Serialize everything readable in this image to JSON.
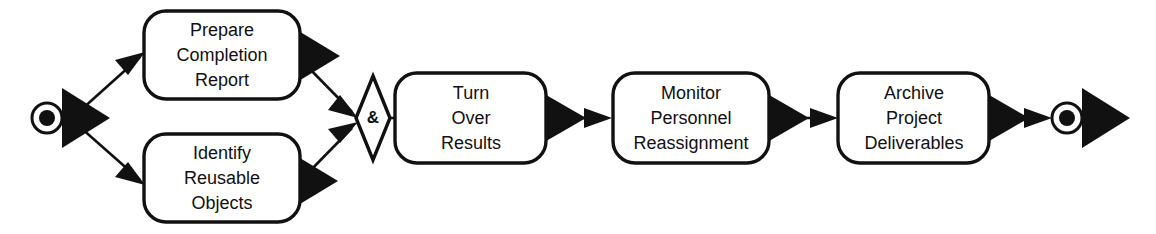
{
  "diagram": {
    "type": "activity-diagram",
    "colors": {
      "stroke": "#111111",
      "fill": "#ffffff",
      "text": "#111111"
    },
    "start_node": {
      "name": "start-node",
      "label": ""
    },
    "end_node": {
      "name": "end-node",
      "label": ""
    },
    "gateway": {
      "name": "and-join-gateway",
      "label": "&"
    },
    "activities": [
      {
        "id": "prepare-completion-report",
        "lines": [
          "Prepare",
          "Completion",
          "Report"
        ]
      },
      {
        "id": "identify-reusable-objects",
        "lines": [
          "Identify",
          "Reusable",
          "Objects"
        ]
      },
      {
        "id": "turn-over-results",
        "lines": [
          "Turn",
          "Over",
          "Results"
        ]
      },
      {
        "id": "monitor-personnel-reassignment",
        "lines": [
          "Monitor",
          "Personnel",
          "Reassignment"
        ]
      },
      {
        "id": "archive-project-deliverables",
        "lines": [
          "Archive",
          "Project",
          "Deliverables"
        ]
      }
    ],
    "flows": [
      {
        "id": "flow-start-to-prepare",
        "from": "start-node",
        "to": "prepare-completion-report",
        "label": ""
      },
      {
        "id": "flow-start-to-identify",
        "from": "start-node",
        "to": "identify-reusable-objects",
        "label": ""
      },
      {
        "id": "flow-prepare-to-gateway",
        "from": "prepare-completion-report",
        "to": "and-join-gateway",
        "label": ""
      },
      {
        "id": "flow-identify-to-gateway",
        "from": "identify-reusable-objects",
        "to": "and-join-gateway",
        "label": ""
      },
      {
        "id": "flow-gateway-to-turnover",
        "from": "and-join-gateway",
        "to": "turn-over-results",
        "label": ""
      },
      {
        "id": "flow-turnover-to-monitor",
        "from": "turn-over-results",
        "to": "monitor-personnel-reassignment",
        "label": ""
      },
      {
        "id": "flow-monitor-to-archive",
        "from": "monitor-personnel-reassignment",
        "to": "archive-project-deliverables",
        "label": ""
      },
      {
        "id": "flow-archive-to-end",
        "from": "archive-project-deliverables",
        "to": "end-node",
        "label": ""
      }
    ]
  }
}
